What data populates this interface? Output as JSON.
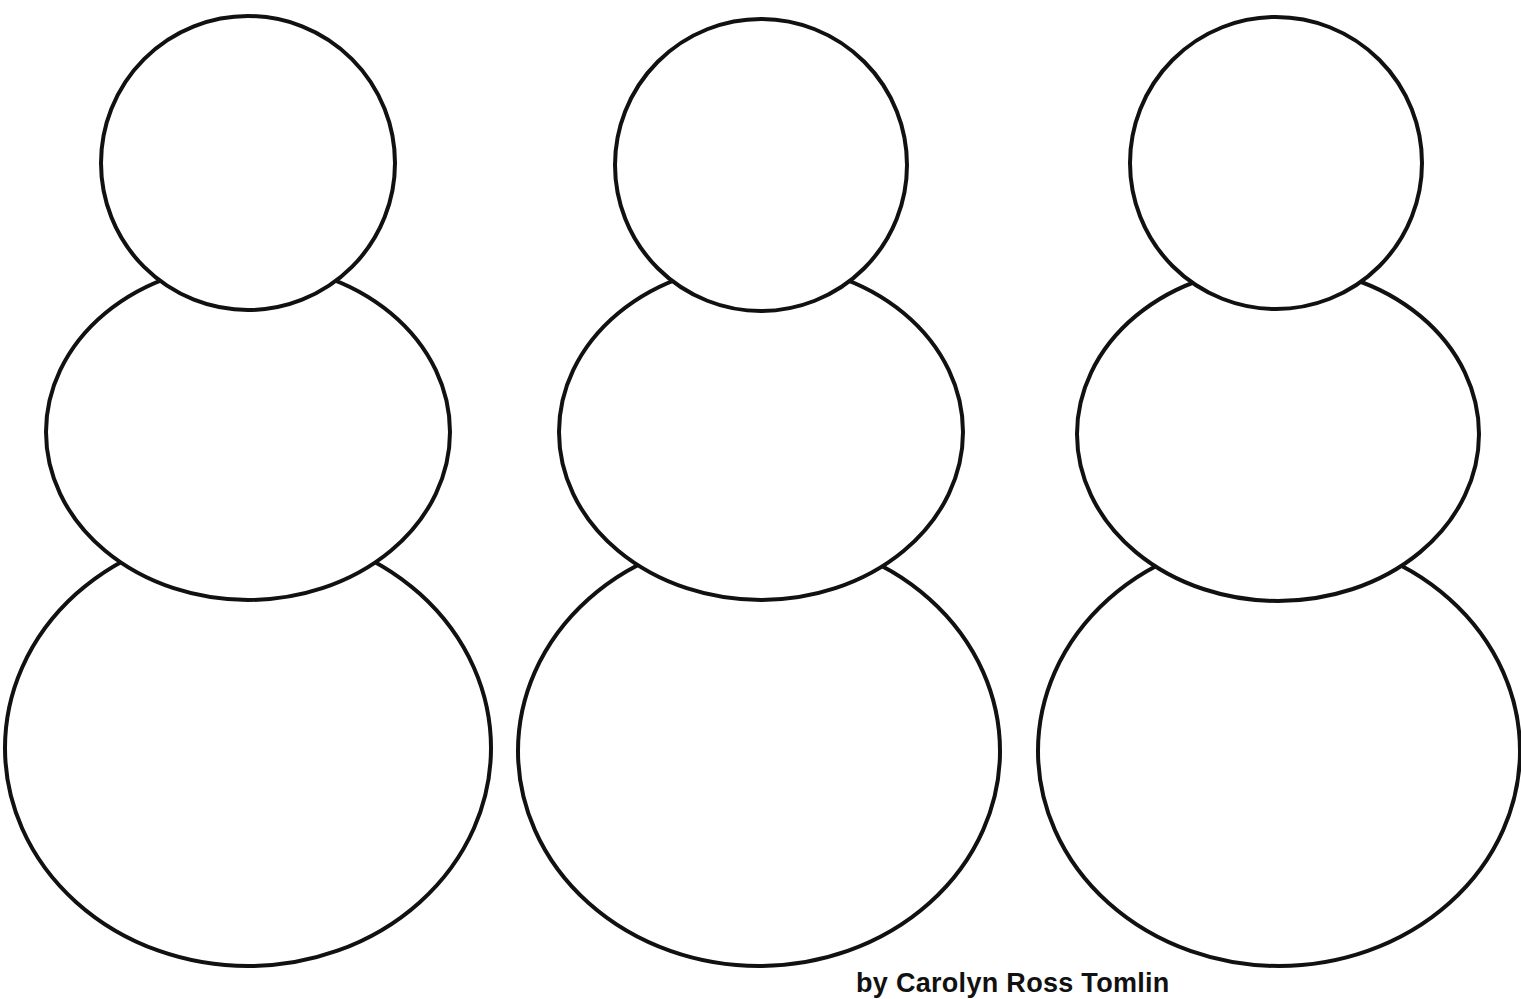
{
  "page": {
    "background": "#ffffff",
    "stroke_color": "#111111",
    "stroke_width": 4
  },
  "snowmen": [
    {
      "name": "snowman-1",
      "head": {
        "cx": 248,
        "cy": 163,
        "rx": 147,
        "ry": 147
      },
      "middle": {
        "cx": 248,
        "cy": 432,
        "rx": 202,
        "ry": 168
      },
      "bottom": {
        "cx": 248,
        "cy": 748,
        "rx": 243,
        "ry": 218
      }
    },
    {
      "name": "snowman-2",
      "head": {
        "cx": 761,
        "cy": 165,
        "rx": 146,
        "ry": 146
      },
      "middle": {
        "cx": 761,
        "cy": 432,
        "rx": 202,
        "ry": 168
      },
      "bottom": {
        "cx": 759,
        "cy": 751,
        "rx": 241,
        "ry": 215
      }
    },
    {
      "name": "snowman-3",
      "head": {
        "cx": 1276,
        "cy": 163,
        "rx": 146,
        "ry": 146
      },
      "middle": {
        "cx": 1278,
        "cy": 434,
        "rx": 201,
        "ry": 167
      },
      "bottom": {
        "cx": 1279,
        "cy": 751,
        "rx": 241,
        "ry": 215
      }
    }
  ],
  "credit": {
    "text": "by Carolyn Ross Tomlin"
  }
}
